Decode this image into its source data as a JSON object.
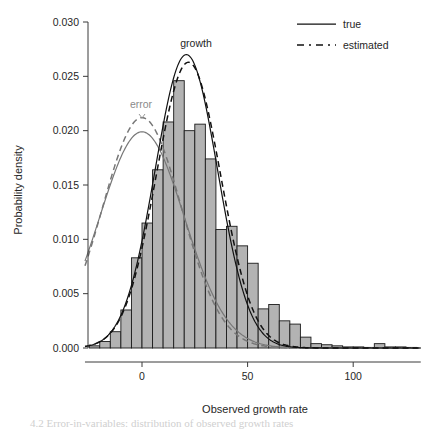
{
  "figure": {
    "background_color": "#ffffff",
    "bottom_caption_fragment": "4.2 Error-in-variables: distribution of observed growth rates"
  },
  "chart_data": {
    "type": "bar",
    "title": "",
    "xlabel": "Observed growth rate",
    "ylabel": "Probability density",
    "xlim": [
      -27,
      132
    ],
    "ylim": [
      0.0,
      0.0305
    ],
    "xticks": [
      0,
      50,
      100
    ],
    "xtick_labels": [
      "0",
      "50",
      "100"
    ],
    "yticks": [
      0.0,
      0.005,
      0.01,
      0.015,
      0.02,
      0.025,
      0.03
    ],
    "ytick_labels": [
      "0.000",
      "0.005",
      "0.010",
      "0.015",
      "0.020",
      "0.025",
      "0.030"
    ],
    "grid": false,
    "bar_fill_color": "#b3b3b3",
    "bar_edge_color": "#1a1a1a",
    "bin_width": 5,
    "bin_starts": [
      -25,
      -20,
      -15,
      -10,
      -5,
      0,
      5,
      10,
      15,
      20,
      25,
      30,
      35,
      40,
      45,
      50,
      55,
      60,
      65,
      70,
      75,
      80,
      85,
      90,
      95,
      100,
      105,
      110,
      115,
      120,
      125
    ],
    "bin_labels": [
      "-25",
      "-20",
      "-15",
      "-10",
      "-5",
      "0",
      "5",
      "10",
      "15",
      "20",
      "25",
      "30",
      "35",
      "40",
      "45",
      "50",
      "55",
      "60",
      "65",
      "70",
      "75",
      "80",
      "85",
      "90",
      "95",
      "100",
      "105",
      "110",
      "115",
      "120",
      "125"
    ],
    "values": [
      0.0002,
      0.0006,
      0.0015,
      0.0035,
      0.0083,
      0.0115,
      0.0164,
      0.0208,
      0.0246,
      0.02,
      0.0206,
      0.0174,
      0.0109,
      0.0112,
      0.0094,
      0.0078,
      0.0036,
      0.004,
      0.0025,
      0.0022,
      0.001,
      0.0004,
      0.0003,
      0.0002,
      0.0001,
      0.0001,
      0.0,
      0.0004,
      0.0001,
      0.0001,
      0.0
    ],
    "series": [
      {
        "name": "error-true",
        "style": "solid",
        "color": "#777777",
        "distribution": "normal",
        "mean": 0.0,
        "sd": 20.0,
        "peak_value": 0.0199,
        "peak_x": 0
      },
      {
        "name": "error-estimated",
        "style": "dashed",
        "color": "#777777",
        "distribution": "normal",
        "mean": 0.0,
        "sd": 18.8,
        "peak_value": 0.0212,
        "peak_x": 0
      },
      {
        "name": "growth-true",
        "style": "solid",
        "color": "#111111",
        "distribution": "normal",
        "mean": 21.0,
        "sd": 14.8,
        "peak_value": 0.027,
        "peak_x": 21
      },
      {
        "name": "growth-estimated",
        "style": "dashed",
        "color": "#111111",
        "distribution": "normal",
        "mean": 22.0,
        "sd": 15.2,
        "peak_value": 0.0263,
        "peak_x": 22
      }
    ],
    "annotations": [
      {
        "text": "growth",
        "x": 22,
        "y": 0.0292,
        "color": "#262626"
      },
      {
        "text": "error",
        "x": -3,
        "y": 0.023,
        "color": "#8a8a8a"
      }
    ],
    "legend": {
      "position": "top-right",
      "entries": [
        {
          "label": "true",
          "style": "solid"
        },
        {
          "label": "estimated",
          "style": "dashed"
        }
      ]
    }
  }
}
